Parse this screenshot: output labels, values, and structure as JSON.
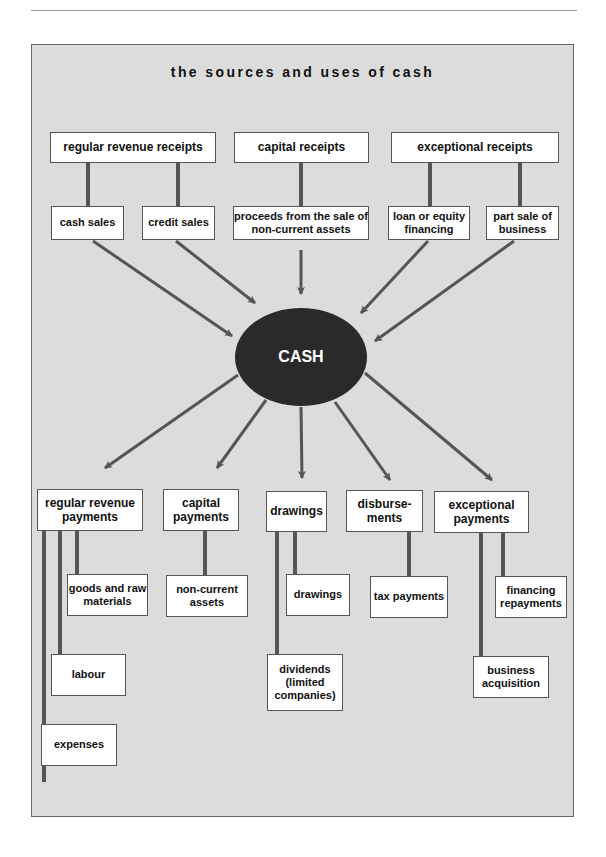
{
  "page": {
    "header_text": "Managing Cash Flow",
    "title": "the sources and uses of cash"
  },
  "center": {
    "label": "CASH"
  },
  "sources": {
    "categories": [
      {
        "label": "regular revenue receipts",
        "items": [
          "cash sales",
          "credit sales"
        ]
      },
      {
        "label": "capital receipts",
        "items": [
          "proceeds from the sale of non-current assets"
        ]
      },
      {
        "label": "exceptional receipts",
        "items": [
          "loan or equity financing",
          "part sale of business"
        ]
      }
    ]
  },
  "uses": {
    "categories": [
      {
        "label": "regular revenue payments",
        "items": [
          "goods and raw materials",
          "labour",
          "expenses"
        ]
      },
      {
        "label": "capital payments",
        "items": [
          "non-current assets"
        ]
      },
      {
        "label": "drawings",
        "items": [
          "drawings",
          "dividends (limited companies)"
        ]
      },
      {
        "label": "disburse-ments",
        "items": [
          "tax payments"
        ]
      },
      {
        "label": "exceptional payments",
        "items": [
          "financing repayments",
          "business acquisition"
        ]
      }
    ]
  },
  "colors": {
    "panel": "#dcdcdc",
    "ellipse": "#2a2a2a",
    "connector": "#555555",
    "box": "#ffffff"
  }
}
